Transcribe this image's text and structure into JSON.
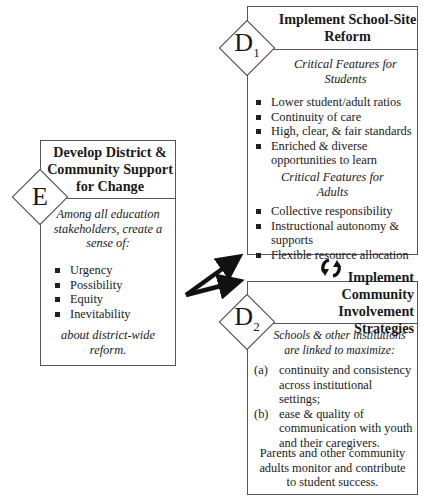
{
  "diagram": {
    "nodes": {
      "E": {
        "badge": "E",
        "title_lines": [
          "Develop District &",
          "Community Support",
          "for Change"
        ],
        "intro_lines": [
          "Among all education",
          "stakeholders, create a",
          "sense of:"
        ],
        "bullets": [
          "Urgency",
          "Possibility",
          "Equity",
          "Inevitability"
        ],
        "outro_lines": [
          "about district-wide",
          "reform."
        ]
      },
      "D1": {
        "badge": "D",
        "badge_sub": "1",
        "title_lines": [
          "Implement School-Site",
          "Reform"
        ],
        "section_students": {
          "heading_lines": [
            "Critical Features for",
            "Students"
          ],
          "bullets": [
            "Lower student/adult ratios",
            "Continuity of care",
            "High, clear, & fair standards",
            "Enriched & diverse opportunities to learn"
          ]
        },
        "section_adults": {
          "heading_lines": [
            "Critical Features for",
            "Adults"
          ],
          "bullets": [
            "Collective responsibility",
            "Instructional autonomy & supports",
            "Flexible resource allocation"
          ]
        }
      },
      "D2": {
        "badge": "D",
        "badge_sub": "2",
        "title_lines": [
          "Implement Community",
          "Involvement Strategies"
        ],
        "intro_lines": [
          "Schools & other institutions",
          "are linked to maximize:"
        ],
        "items": [
          {
            "marker": "(a)",
            "text": "continuity and consistency across institutional settings;"
          },
          {
            "marker": "(b)",
            "text": "ease & quality of communication with youth and their caregivers."
          }
        ],
        "outro_lines": [
          "Parents and other community",
          "adults monitor and contribute",
          "to student success."
        ]
      }
    },
    "edges": [
      {
        "from": "E",
        "to": "D1",
        "type": "arrow"
      },
      {
        "from": "E",
        "to": "D2",
        "type": "arrow"
      },
      {
        "between": [
          "D1",
          "D2"
        ],
        "type": "cycle-icon"
      }
    ]
  }
}
